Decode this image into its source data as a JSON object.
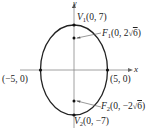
{
  "diagram": {
    "type": "ellipse",
    "axes": {
      "x_label": "x",
      "y_label": "y"
    },
    "points": {
      "v1": {
        "name": "V",
        "sub": "1",
        "coords": "(0, 7)"
      },
      "v2": {
        "name": "V",
        "sub": "2",
        "coords": "(0, −7)"
      },
      "f1": {
        "name": "F",
        "sub": "1",
        "coords_pre": "(0, 2",
        "coords_rad": "6",
        "coords_post": ")"
      },
      "f2": {
        "name": "F",
        "sub": "2",
        "coords_pre": "(0, −2",
        "coords_rad": "6",
        "coords_post": ")"
      },
      "left": {
        "coords": "(−5, 0)"
      },
      "right": {
        "coords": "(5, 0)"
      }
    },
    "colors": {
      "curve": "#222222",
      "axis": "#888888"
    }
  }
}
